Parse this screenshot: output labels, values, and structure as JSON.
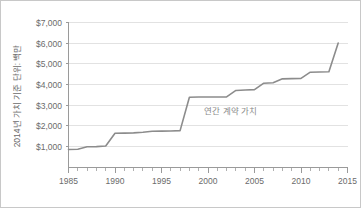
{
  "chart_data": {
    "type": "line",
    "title": "",
    "subtitle": "",
    "xlabel": "",
    "ylabel": "2014년 가치 기준 단위: 백만",
    "xlim": [
      1985,
      2015
    ],
    "ylim": [
      0,
      7000
    ],
    "grid": true,
    "legend_position": "none",
    "annotations": [
      {
        "text": "연간 계약 가치",
        "x": 1999.6,
        "y": 2600
      }
    ],
    "y_ticks": [
      {
        "value": 1000,
        "label": "$1,000"
      },
      {
        "value": 2000,
        "label": "$2,000"
      },
      {
        "value": 3000,
        "label": "$3,000"
      },
      {
        "value": 4000,
        "label": "$4,000"
      },
      {
        "value": 5000,
        "label": "$5,000"
      },
      {
        "value": 6000,
        "label": "$6,000"
      },
      {
        "value": 7000,
        "label": "$7,000"
      }
    ],
    "x_ticks": [
      {
        "value": 1985,
        "label": "1985"
      },
      {
        "value": 1990,
        "label": "1990"
      },
      {
        "value": 1995,
        "label": "1995"
      },
      {
        "value": 2000,
        "label": "2000"
      },
      {
        "value": 2005,
        "label": "2005"
      },
      {
        "value": 2010,
        "label": "2010"
      },
      {
        "value": 2015,
        "label": "2015"
      }
    ],
    "x_minor_ticks": [
      1986,
      1987,
      1988,
      1989,
      1991,
      1992,
      1993,
      1994,
      1996,
      1997,
      1998,
      1999,
      2001,
      2002,
      2003,
      2004,
      2006,
      2007,
      2008,
      2009,
      2011,
      2012,
      2013,
      2014
    ],
    "series": [
      {
        "name": "연간 계약 가치",
        "color": "#8c8c8c",
        "x": [
          1985,
          1986,
          1987,
          1988,
          1989,
          1990,
          1991,
          1992,
          1993,
          1994,
          1995,
          1996,
          1997,
          1998,
          1999,
          2000,
          2001,
          2002,
          2003,
          2004,
          2005,
          2006,
          2007,
          2008,
          2009,
          2010,
          2011,
          2012,
          2013,
          2014
        ],
        "values": [
          870,
          880,
          1000,
          1010,
          1040,
          1650,
          1660,
          1670,
          1700,
          1750,
          1755,
          1760,
          1780,
          3390,
          3400,
          3400,
          3400,
          3410,
          3720,
          3740,
          3760,
          4070,
          4090,
          4280,
          4290,
          4300,
          4600,
          4610,
          4620,
          6010
        ]
      }
    ]
  },
  "axis": {
    "y_axis_title": "2014년 가치 기준 단위: 백만"
  }
}
